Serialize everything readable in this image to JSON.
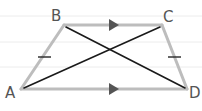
{
  "diagram": {
    "type": "isosceles-trapezoid",
    "background": "lined-paper",
    "colors": {
      "paper": "#ffffff",
      "rule_line": "#ececec",
      "side_stroke": "#bdbdbd",
      "diagonal_stroke": "#1a1a1a",
      "arrow_fill": "#555555",
      "tick_stroke": "#333333",
      "label": "#555555"
    },
    "vertices": [
      {
        "name": "A",
        "label": "A",
        "x": 21,
        "y": 89
      },
      {
        "name": "B",
        "label": "B",
        "x": 64,
        "y": 25
      },
      {
        "name": "C",
        "label": "C",
        "x": 162,
        "y": 25
      },
      {
        "name": "D",
        "label": "D",
        "x": 187,
        "y": 89
      }
    ],
    "parallel_sides": [
      "BC",
      "AD"
    ],
    "congruent_sides": [
      "AB",
      "CD"
    ],
    "diagonals": [
      "AC",
      "BD"
    ]
  }
}
